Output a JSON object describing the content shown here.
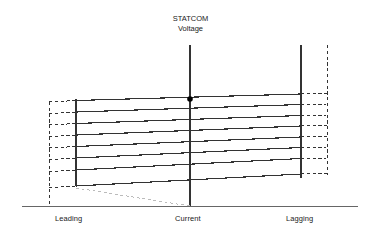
{
  "figure": {
    "title_line1": "STATCOM",
    "title_line2": "Voltage",
    "axis_labels": {
      "left": "Leading",
      "center": "Current",
      "right": "Lagging"
    },
    "colors": {
      "line": "#333333",
      "dashed": "#333333",
      "faint_dashed": "#bbbbbb",
      "baseline": "#555555",
      "dot": "#000000",
      "background": "#ffffff",
      "text": "#1a1a1a"
    }
  },
  "chart_data": {
    "type": "line",
    "title": "STATCOM Voltage",
    "xlabel": "Current",
    "ylabel": "STATCOM Voltage",
    "grid": false,
    "legend": null,
    "xlim": [
      22,
      358
    ],
    "ylim": [
      45,
      206
    ],
    "annotations": [
      {
        "name": "operating-point",
        "x": 190,
        "y": 99,
        "marker": "filled-circle",
        "size": 5.6
      }
    ],
    "axes": {
      "baseline_y": 206,
      "baseline_x_start": 22,
      "baseline_x_end": 358,
      "center_axis_x": 190,
      "center_axis_y_top": 45,
      "center_axis_y_bottom": 206
    },
    "boundaries": {
      "leading_solid_x": 76,
      "leading_solid_y_top": 99,
      "leading_solid_y_bottom": 186,
      "leading_dashed_x": 49,
      "leading_dashed_y_top": 102,
      "leading_dashed_y_bottom": 206,
      "lagging_solid_x": 301,
      "lagging_solid_y_top": 45,
      "lagging_solid_y_bottom": 178,
      "lagging_dashed_x": 327,
      "lagging_dashed_y_top": 45,
      "lagging_dashed_y_bottom": 175
    },
    "series": [
      {
        "name": "vi-slope-1",
        "x": [
          76,
          301
        ],
        "y": [
          100.5,
          94.0
        ],
        "dash_left_y": 102.0,
        "dash_right_y": 93.5
      },
      {
        "name": "vi-slope-2",
        "x": [
          76,
          301
        ],
        "y": [
          112.0,
          104.5
        ],
        "dash_left_y": 113.5,
        "dash_right_y": 104.0
      },
      {
        "name": "vi-slope-3",
        "x": [
          76,
          301
        ],
        "y": [
          123.5,
          115.5
        ],
        "dash_left_y": 125.0,
        "dash_right_y": 115.0
      },
      {
        "name": "vi-slope-4",
        "x": [
          76,
          301
        ],
        "y": [
          135.0,
          126.0
        ],
        "dash_left_y": 136.5,
        "dash_right_y": 125.5
      },
      {
        "name": "vi-slope-5",
        "x": [
          76,
          301
        ],
        "y": [
          146.5,
          137.0
        ],
        "dash_left_y": 148.0,
        "dash_right_y": 136.5
      },
      {
        "name": "vi-slope-6",
        "x": [
          76,
          301
        ],
        "y": [
          158.0,
          147.5
        ],
        "dash_left_y": 159.5,
        "dash_right_y": 147.0
      },
      {
        "name": "vi-slope-7",
        "x": [
          76,
          301
        ],
        "y": [
          170.0,
          158.5
        ],
        "dash_left_y": 171.5,
        "dash_right_y": 158.0
      },
      {
        "name": "vi-slope-8",
        "x": [
          76,
          301
        ],
        "y": [
          186.0,
          174.0
        ],
        "dash_left_y": 187.5,
        "dash_right_y": 173.5
      }
    ],
    "guide_line": {
      "name": "lower-limit-guide",
      "x": [
        76,
        190
      ],
      "y": [
        188,
        206
      ],
      "style": "dashed",
      "color": "#bbbbbb"
    }
  }
}
